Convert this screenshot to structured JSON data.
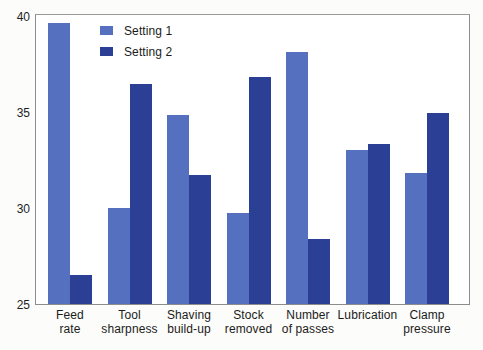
{
  "chart_data": {
    "type": "bar",
    "title": "",
    "subtitle": "",
    "xlabel": "",
    "ylabel": "",
    "ylim": [
      25,
      40
    ],
    "yticks": [
      25,
      30,
      35,
      40
    ],
    "ytick_labels": [
      "25",
      "30",
      "35",
      "40"
    ],
    "grid": false,
    "legend_position": "top-left inside plot",
    "categories": [
      "Feed rate",
      "Tool sharpness",
      "Shaving build-up",
      "Stock removed",
      "Number of passes",
      "Lubrication",
      "Clamp pressure"
    ],
    "category_lines": [
      [
        "Feed",
        "rate"
      ],
      [
        "Tool",
        "sharpness"
      ],
      [
        "Shaving",
        "build-up"
      ],
      [
        "Stock",
        "removed"
      ],
      [
        "Number",
        "of passes"
      ],
      [
        "Lubrication",
        ""
      ],
      [
        "Clamp",
        "pressure"
      ]
    ],
    "series": [
      {
        "name": "Setting 1",
        "color": "#5570be",
        "values": [
          39.6,
          30.0,
          34.8,
          29.7,
          38.1,
          33.0,
          31.8
        ]
      },
      {
        "name": "Setting 2",
        "color": "#2b3f94",
        "values": [
          26.5,
          36.4,
          31.7,
          36.8,
          28.4,
          33.3,
          34.9
        ]
      }
    ]
  },
  "legend": {
    "items": [
      {
        "label": "Setting 1",
        "color": "#5570be"
      },
      {
        "label": "Setting 2",
        "color": "#2b3f94"
      }
    ]
  },
  "axis": {
    "y_tick_labels": [
      "40",
      "35",
      "30",
      "25"
    ]
  }
}
